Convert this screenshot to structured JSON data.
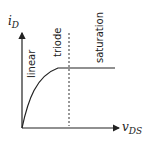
{
  "diagram": {
    "y_axis": {
      "label_main": "i",
      "label_sub": "D"
    },
    "x_axis": {
      "label_main": "v",
      "label_sub": "DS"
    },
    "regions": [
      {
        "label": "linear"
      },
      {
        "label": "triode"
      },
      {
        "label": "saturation"
      }
    ],
    "colors": {
      "line": "#222222",
      "background": "#ffffff"
    }
  }
}
